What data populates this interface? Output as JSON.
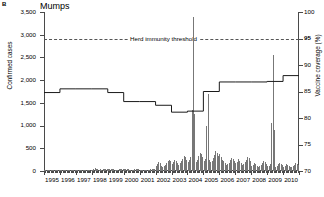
{
  "figure": {
    "panel_letter": "B",
    "title": "Mumps"
  },
  "axes": {
    "left": {
      "title": "Confirmed cases",
      "ticks": [
        "0",
        "500",
        "1,000",
        "1,500",
        "2,000",
        "2,500",
        "3,000",
        "3,500"
      ],
      "min": 0,
      "max": 3500
    },
    "right": {
      "title": "Vaccine coverage (%)",
      "ticks": [
        "70",
        "75",
        "80",
        "85",
        "90",
        "95",
        "100"
      ],
      "min": 70,
      "max": 100
    },
    "x": {
      "years": [
        "1995",
        "1996",
        "1997",
        "1998",
        "1999",
        "2000",
        "2001",
        "2002",
        "2003",
        "2004",
        "2005",
        "2006",
        "2007",
        "2008",
        "2009",
        "2010"
      ]
    }
  },
  "annotations": {
    "herd_immunity_label": "Herd immunity threshold",
    "herd_immunity_value": 95
  },
  "colors": {
    "bar": "#777777",
    "line": "#1a1a1a",
    "axis": "#4a4a4a",
    "threshold": "#555555"
  },
  "chart_data": {
    "type": "bar",
    "title": "Mumps",
    "xlabel": "",
    "ylabel": "Confirmed cases",
    "y2label": "Vaccine coverage (%)",
    "ylim": [
      0,
      3500
    ],
    "y2lim": [
      70,
      100
    ],
    "grid": false,
    "legend": "none",
    "x_tick_labels": [
      "1995",
      "1996",
      "1997",
      "1998",
      "1999",
      "2000",
      "2001",
      "2002",
      "2003",
      "2004",
      "2005",
      "2006",
      "2007",
      "2008",
      "2009",
      "2010"
    ],
    "series": [
      {
        "name": "Confirmed cases",
        "type": "bar",
        "axis": "left",
        "color": "#777777",
        "bin": "monthly",
        "start": "1995-01",
        "values": [
          12,
          10,
          14,
          11,
          9,
          8,
          10,
          7,
          9,
          12,
          11,
          10,
          10,
          9,
          12,
          10,
          8,
          7,
          9,
          8,
          10,
          11,
          9,
          10,
          12,
          11,
          14,
          12,
          10,
          9,
          11,
          10,
          12,
          14,
          13,
          12,
          30,
          46,
          58,
          50,
          40,
          30,
          35,
          32,
          40,
          52,
          48,
          42,
          44,
          40,
          50,
          42,
          34,
          28,
          30,
          32,
          38,
          46,
          44,
          40,
          48,
          36,
          40,
          34,
          30,
          26,
          28,
          30,
          34,
          40,
          38,
          36,
          30,
          25,
          28,
          24,
          22,
          20,
          26,
          30,
          34,
          40,
          44,
          50,
          120,
          150,
          200,
          170,
          120,
          90,
          110,
          140,
          180,
          230,
          250,
          210,
          160,
          200,
          250,
          215,
          175,
          140,
          170,
          210,
          260,
          320,
          300,
          250,
          200,
          240,
          310,
          290,
          230,
          180,
          200,
          250,
          330,
          400,
          380,
          300,
          220,
          260,
          330,
          300,
          250,
          200,
          230,
          280,
          360,
          430,
          400,
          330,
          380,
          300,
          250,
          215,
          170,
          130,
          150,
          185,
          240,
          290,
          260,
          210,
          170,
          200,
          260,
          230,
          180,
          140,
          160,
          200,
          250,
          310,
          285,
          230,
          120,
          140,
          180,
          150,
          120,
          95,
          110,
          135,
          170,
          210,
          195,
          160,
          100,
          120,
          150,
          130,
          105,
          85,
          95,
          115,
          145,
          180,
          165,
          135,
          95,
          115,
          145,
          125,
          100,
          80,
          90,
          110,
          140,
          175,
          160,
          130
        ],
        "peaks": [
          {
            "label": "2004 outbreak peak",
            "approx_value": 3400
          },
          {
            "label": "2005 secondary peak",
            "approx_value": 1700
          },
          {
            "label": "2009 peak",
            "approx_value": 2550
          }
        ]
      },
      {
        "name": "Vaccine coverage",
        "type": "step-line",
        "axis": "right",
        "color": "#1a1a1a",
        "steps": [
          {
            "year": 1995,
            "value": 84.8
          },
          {
            "year": 1996,
            "value": 85.5
          },
          {
            "year": 1997,
            "value": 85.5
          },
          {
            "year": 1998,
            "value": 85.5
          },
          {
            "year": 1999,
            "value": 84.8
          },
          {
            "year": 2000,
            "value": 83.1
          },
          {
            "year": 2001,
            "value": 83.1
          },
          {
            "year": 2002,
            "value": 82.4
          },
          {
            "year": 2003,
            "value": 81.1
          },
          {
            "year": 2004,
            "value": 81.3
          },
          {
            "year": 2005,
            "value": 85.0
          },
          {
            "year": 2006,
            "value": 86.8
          },
          {
            "year": 2007,
            "value": 86.8
          },
          {
            "year": 2008,
            "value": 86.8
          },
          {
            "year": 2009,
            "value": 86.9
          },
          {
            "year": 2010,
            "value": 88.0
          }
        ]
      }
    ],
    "annotations": [
      {
        "type": "hline",
        "axis": "right",
        "value": 95,
        "label": "Herd immunity threshold",
        "style": "dashed"
      }
    ]
  }
}
